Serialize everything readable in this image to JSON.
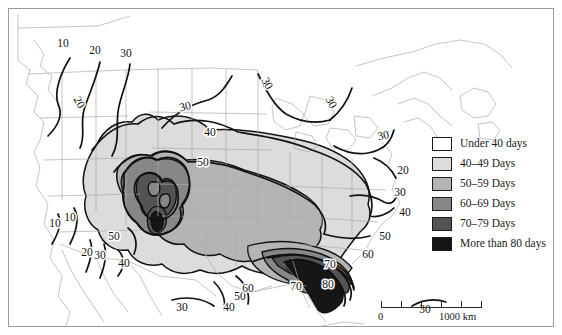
{
  "figure": {
    "kind": "choropleth-isoline-map",
    "region": "North America (contiguous United States and surroundings)",
    "variable": "Average annual number of days with thunderstorms"
  },
  "legend": {
    "title": "",
    "items": [
      {
        "label": "Under 40 days",
        "color": "#ffffff",
        "min": 0,
        "max": 39
      },
      {
        "label": "40–49 Days",
        "color": "#dcdcdc",
        "min": 40,
        "max": 49
      },
      {
        "label": "50–59 Days",
        "color": "#b4b4b4",
        "min": 50,
        "max": 59
      },
      {
        "label": "60–69 Days",
        "color": "#878787",
        "min": 60,
        "max": 69
      },
      {
        "label": "70–79 Days",
        "color": "#545454",
        "min": 70,
        "max": 79
      },
      {
        "label": "More than 80 days",
        "color": "#161616",
        "min": 80,
        "max": null
      }
    ]
  },
  "scalebar": {
    "start_label": "0",
    "end_label": "1000 km",
    "segments": 5,
    "length_km": 1000
  },
  "contour_labels": [
    {
      "value": "10",
      "x": 63,
      "y": 47,
      "rotate": 0
    },
    {
      "value": "20",
      "x": 95,
      "y": 54,
      "rotate": 0
    },
    {
      "value": "30",
      "x": 126,
      "y": 57,
      "rotate": 0
    },
    {
      "value": "20",
      "x": 76,
      "y": 104,
      "rotate": 62
    },
    {
      "value": "30",
      "x": 186,
      "y": 110,
      "rotate": -14
    },
    {
      "value": "30",
      "x": 264,
      "y": 85,
      "rotate": 62
    },
    {
      "value": "30",
      "x": 328,
      "y": 104,
      "rotate": 62
    },
    {
      "value": "30",
      "x": 384,
      "y": 139,
      "rotate": -12
    },
    {
      "value": "40",
      "x": 210,
      "y": 136,
      "rotate": 0
    },
    {
      "value": "50",
      "x": 203,
      "y": 166,
      "rotate": 0
    },
    {
      "value": "20",
      "x": 403,
      "y": 174,
      "rotate": 0
    },
    {
      "value": "30",
      "x": 400,
      "y": 196,
      "rotate": 0
    },
    {
      "value": "40",
      "x": 405,
      "y": 216,
      "rotate": 0
    },
    {
      "value": "50",
      "x": 385,
      "y": 240,
      "rotate": 0
    },
    {
      "value": "60",
      "x": 368,
      "y": 258,
      "rotate": 0
    },
    {
      "value": "10",
      "x": 55,
      "y": 227,
      "rotate": 0
    },
    {
      "value": "10",
      "x": 70,
      "y": 221,
      "rotate": 0
    },
    {
      "value": "20",
      "x": 87,
      "y": 256,
      "rotate": 0
    },
    {
      "value": "30",
      "x": 100,
      "y": 259,
      "rotate": 0
    },
    {
      "value": "50",
      "x": 114,
      "y": 240,
      "rotate": 0
    },
    {
      "value": "40",
      "x": 124,
      "y": 267,
      "rotate": 0
    },
    {
      "value": "30",
      "x": 182,
      "y": 311,
      "rotate": 0
    },
    {
      "value": "40",
      "x": 229,
      "y": 311,
      "rotate": 0
    },
    {
      "value": "50",
      "x": 240,
      "y": 300,
      "rotate": 0
    },
    {
      "value": "60",
      "x": 248,
      "y": 292,
      "rotate": 0
    },
    {
      "value": "70",
      "x": 296,
      "y": 290,
      "rotate": 0
    },
    {
      "value": "80",
      "x": 328,
      "y": 288,
      "rotate": 0
    },
    {
      "value": "70",
      "x": 330,
      "y": 268,
      "rotate": 0
    },
    {
      "value": "30",
      "x": 425,
      "y": 313,
      "rotate": 0
    }
  ]
}
